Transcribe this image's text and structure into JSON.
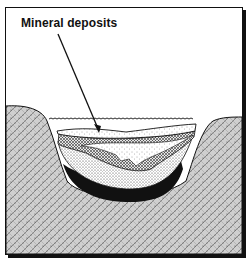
{
  "diagram": {
    "type": "geologic cross-section",
    "labels": [
      {
        "text": "Mineral deposits",
        "points_to": "deposit layers in basin"
      }
    ],
    "layers": [
      {
        "name": "water",
        "pattern": "wavy surface line"
      },
      {
        "name": "upper sediment",
        "pattern": "light stipple"
      },
      {
        "name": "mineral deposits",
        "pattern": "cross-hatch"
      },
      {
        "name": "lower sediment",
        "pattern": "dense stipple"
      },
      {
        "name": "dark bottom layer",
        "pattern": "solid black"
      },
      {
        "name": "bedrock",
        "pattern": "granite texture"
      }
    ]
  }
}
